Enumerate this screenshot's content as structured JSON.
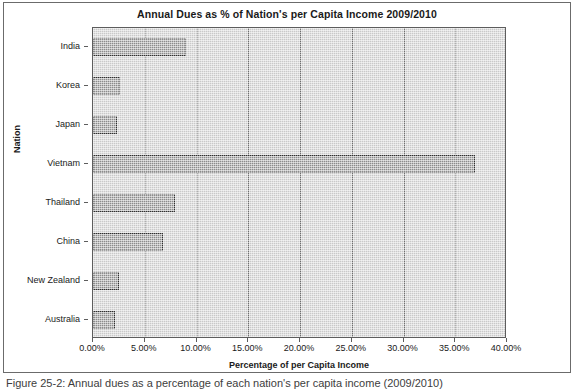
{
  "figure": {
    "caption": "Figure 25-2: Annual dues as a percentage of each nation's per capita income (2009/2010)"
  },
  "chart_data": {
    "type": "bar",
    "orientation": "horizontal",
    "title": "Annual Dues as % of Nation's per Capita Income 2009/2010",
    "xlabel": "Percentage of per Capita Income",
    "ylabel": "Nation",
    "categories": [
      "India",
      "Korea",
      "Japan",
      "Vietnam",
      "Thailand",
      "China",
      "New Zealand",
      "Australia"
    ],
    "values": [
      9.0,
      2.6,
      2.3,
      36.9,
      7.9,
      6.8,
      2.5,
      2.1
    ],
    "xlim": [
      0,
      40
    ],
    "xticks": [
      0,
      5,
      10,
      15,
      20,
      25,
      30,
      35,
      40
    ],
    "xtick_labels": [
      "0.00%",
      "5.00%",
      "10.00%",
      "15.00%",
      "20.00%",
      "25.00%",
      "30.00%",
      "35.00%",
      "40.00%"
    ],
    "grid": "vertical",
    "legend": "none",
    "series_color": "#8c8c8c",
    "plot_background": "#c9c9c9",
    "bar_border_color": "#2f2f2f"
  }
}
